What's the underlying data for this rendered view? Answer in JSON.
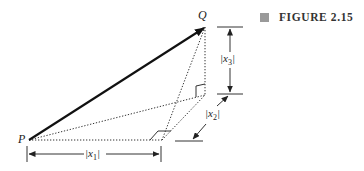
{
  "figure": {
    "label": "FIGURE 2.15",
    "marker_color": "#9a9a9a"
  },
  "points": {
    "P": {
      "label": "P",
      "x": 29,
      "y": 140
    },
    "Q": {
      "label": "Q",
      "x": 205,
      "y": 27
    },
    "R": {
      "x": 205,
      "y": 95
    },
    "S": {
      "x": 162,
      "y": 140
    }
  },
  "dimensions": {
    "x1": "|x1|",
    "x2": "|x2|",
    "x3": "|x3|"
  },
  "labels": {
    "P": "P",
    "Q": "Q",
    "x1_main": "|x",
    "x1_sub": "1",
    "x1_close": "|",
    "x2_main": "|x",
    "x2_sub": "2",
    "x2_close": "|",
    "x3_main": "|x",
    "x3_sub": "3",
    "x3_close": "|"
  }
}
